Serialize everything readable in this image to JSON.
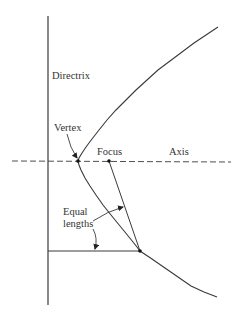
{
  "diagram": {
    "type": "parabola-geometry",
    "labels": {
      "directrix": "Directrix",
      "vertex": "Vertex",
      "focus": "Focus",
      "axis": "Axis",
      "equal_line1": "Equal",
      "equal_line2": "lengths"
    },
    "colors": {
      "line": "#3a3a3a",
      "text": "#333333",
      "background": "#ffffff"
    },
    "points": {
      "vertex": [
        78,
        161
      ],
      "focus": [
        109,
        161
      ],
      "curve_point": [
        140,
        251
      ]
    }
  }
}
